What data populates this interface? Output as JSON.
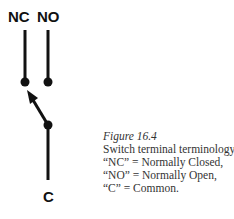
{
  "terminals": {
    "nc": "NC",
    "no": "NO",
    "c": "C"
  },
  "caption": {
    "figure": "Figure 16.4",
    "lines": [
      "Switch terminal terminology:",
      "“NC” = Normally Closed,",
      "“NO” = Normally Open,",
      "“C” = Common."
    ]
  },
  "colors": {
    "stroke": "#111111",
    "caption_text": "#333333"
  }
}
